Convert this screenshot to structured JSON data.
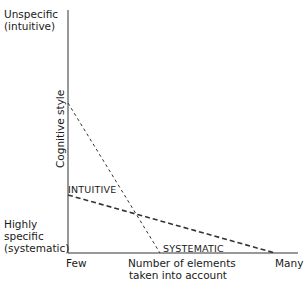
{
  "diagram": {
    "y_axis": {
      "title": "Cognitive style",
      "top_label_line1": "Unspecific",
      "top_label_line2": "(intuitive)",
      "bottom_label_line1": "Highly",
      "bottom_label_line2": "specific",
      "bottom_label_line3": "(systematic)"
    },
    "x_axis": {
      "title_line1": "Number of elements",
      "title_line2": "taken into account",
      "left_label": "Few",
      "right_label": "Many"
    },
    "series": [
      {
        "name": "INTUITIVE",
        "style": "dashed-heavy",
        "start": {
          "x": "Few",
          "y": "moderate"
        },
        "end": {
          "x": "Many",
          "y": "Highly specific"
        }
      },
      {
        "name": "SYSTEMATIC",
        "style": "dashed-light",
        "start": {
          "x": "Few",
          "y": "high (toward unspecific)"
        },
        "end": {
          "x": "mid",
          "y": "Highly specific"
        }
      }
    ]
  }
}
